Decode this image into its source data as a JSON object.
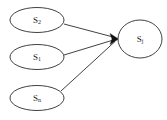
{
  "figure": {
    "background_color": "#ffffff",
    "stroke_color": "#2b2b2b",
    "arrow_color": "#111111"
  },
  "nodes": [
    {
      "id": "s2",
      "name": "S2",
      "base": "S",
      "subscript": "2",
      "role": "source",
      "cx": 37,
      "cy": 20,
      "rx": 27,
      "ry": 12.5
    },
    {
      "id": "s1",
      "name": "S1",
      "base": "S",
      "subscript": "1",
      "role": "source",
      "cx": 37,
      "cy": 57,
      "rx": 27,
      "ry": 12.5
    },
    {
      "id": "sn",
      "name": "Sn",
      "base": "S",
      "subscript": "n",
      "role": "source",
      "cx": 37,
      "cy": 98,
      "rx": 27,
      "ry": 12.5
    },
    {
      "id": "sj",
      "name": "Sj",
      "base": "S",
      "subscript": "j",
      "role": "target",
      "cx": 140,
      "cy": 39,
      "rx": 22,
      "ry": 19
    }
  ],
  "edges": [
    {
      "id": "edge-s2-sj",
      "from": "S2",
      "to": "Sj",
      "x1": 64,
      "y1": 24,
      "x2": 114,
      "y2": 38,
      "arrow": true
    },
    {
      "id": "edge-s1-sj",
      "from": "S1",
      "to": "Sj",
      "x1": 64,
      "y1": 55,
      "x2": 114,
      "y2": 39,
      "arrow": true
    },
    {
      "id": "edge-sn-sj",
      "from": "Sn",
      "to": "Sj",
      "x1": 61,
      "y1": 91,
      "x2": 114,
      "y2": 41,
      "arrow": true
    }
  ],
  "arrow_marker": {
    "tip_x": 118,
    "tip_y": 39,
    "label": "filled-arrowhead"
  }
}
